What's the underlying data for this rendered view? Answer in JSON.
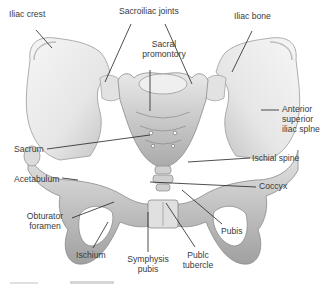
{
  "figure": {
    "labels": {
      "iliac_crest": "Iliac crest",
      "sacroiliac_joints": "Sacroiliac joints",
      "iliac_bone": "Iliac bone",
      "sacral_promontory_1": "Sacral",
      "sacral_promontory_2": "promontory",
      "asis_1": "Anterior",
      "asis_2": "superior",
      "asis_3": "iliac splne",
      "sacrum": "Sacrum",
      "acetabulum": "Acetabulum",
      "ischial_spine": "Ischial spine",
      "coccyx": "Coccyx",
      "obturator_1": "Obturator",
      "obturator_2": "foramen",
      "pubis": "Pubis",
      "ischium": "Ischium",
      "symphysis_1": "Symphysis",
      "symphysis_2": "pubis",
      "pubic_tubercle_1": "Publc",
      "pubic_tubercle_2": "tubercle"
    },
    "colors": {
      "bone_light": "#f1f1f1",
      "bone_mid": "#d4d4d4",
      "bone_dark": "#9a9a9a",
      "leader_line": "#222222",
      "label_text": "#3a3a3a"
    }
  }
}
